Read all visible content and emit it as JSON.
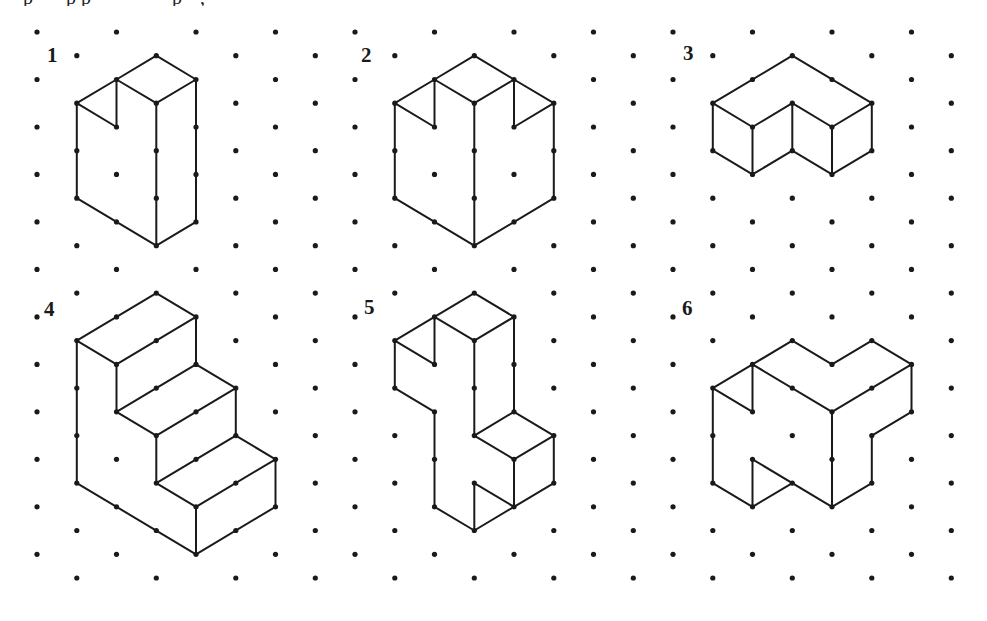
{
  "colors": {
    "background": "#ffffff",
    "dot": "#1a1a1a",
    "line": "#1a1a1a"
  },
  "grid": {
    "type": "isometric-dot",
    "rows": 24,
    "cols_per_row": 12,
    "origin_x": 37,
    "origin_y": 32,
    "half_col_spacing": 39.75,
    "row_spacing": 23.74,
    "dot_radius": 2.6
  },
  "top_text_fragments": [
    {
      "x": 23,
      "text": "p"
    },
    {
      "x": 66,
      "text": "p"
    },
    {
      "x": 81,
      "text": "p"
    },
    {
      "x": 172,
      "text": "p"
    },
    {
      "x": 200,
      "text": ","
    }
  ],
  "figures": [
    {
      "label": "1",
      "label_pos": [
        47,
        62
      ],
      "edges": [
        [
          [
            3,
            1
          ],
          [
            2,
            2
          ]
        ],
        [
          [
            3,
            1
          ],
          [
            4,
            2
          ]
        ],
        [
          [
            2,
            2
          ],
          [
            3,
            3
          ]
        ],
        [
          [
            4,
            2
          ],
          [
            3,
            3
          ]
        ],
        [
          [
            2,
            2
          ],
          [
            1,
            3
          ]
        ],
        [
          [
            2,
            2
          ],
          [
            2,
            4
          ]
        ],
        [
          [
            1,
            3
          ],
          [
            2,
            4
          ]
        ],
        [
          [
            1,
            3
          ],
          [
            1,
            7
          ]
        ],
        [
          [
            3,
            3
          ],
          [
            3,
            9
          ]
        ],
        [
          [
            4,
            2
          ],
          [
            4,
            8
          ]
        ],
        [
          [
            1,
            7
          ],
          [
            3,
            9
          ]
        ],
        [
          [
            3,
            9
          ],
          [
            4,
            8
          ]
        ]
      ]
    },
    {
      "label": "2",
      "label_pos": [
        361,
        62
      ],
      "edges": [
        [
          [
            11,
            1
          ],
          [
            10,
            2
          ]
        ],
        [
          [
            11,
            1
          ],
          [
            12,
            2
          ]
        ],
        [
          [
            10,
            2
          ],
          [
            11,
            3
          ]
        ],
        [
          [
            12,
            2
          ],
          [
            11,
            3
          ]
        ],
        [
          [
            10,
            2
          ],
          [
            9,
            3
          ]
        ],
        [
          [
            10,
            2
          ],
          [
            10,
            4
          ]
        ],
        [
          [
            9,
            3
          ],
          [
            10,
            4
          ]
        ],
        [
          [
            12,
            2
          ],
          [
            13,
            3
          ]
        ],
        [
          [
            12,
            2
          ],
          [
            12,
            4
          ]
        ],
        [
          [
            13,
            3
          ],
          [
            12,
            4
          ]
        ],
        [
          [
            9,
            3
          ],
          [
            9,
            7
          ]
        ],
        [
          [
            11,
            3
          ],
          [
            11,
            9
          ]
        ],
        [
          [
            13,
            3
          ],
          [
            13,
            7
          ]
        ],
        [
          [
            9,
            7
          ],
          [
            11,
            9
          ]
        ],
        [
          [
            11,
            9
          ],
          [
            13,
            7
          ]
        ]
      ]
    },
    {
      "label": "3",
      "label_pos": [
        683,
        60
      ],
      "edges": [
        [
          [
            19,
            1
          ],
          [
            17,
            3
          ]
        ],
        [
          [
            19,
            1
          ],
          [
            21,
            3
          ]
        ],
        [
          [
            17,
            3
          ],
          [
            18,
            4
          ]
        ],
        [
          [
            18,
            4
          ],
          [
            19,
            3
          ]
        ],
        [
          [
            19,
            3
          ],
          [
            20,
            4
          ]
        ],
        [
          [
            20,
            4
          ],
          [
            21,
            3
          ]
        ],
        [
          [
            17,
            3
          ],
          [
            17,
            5
          ]
        ],
        [
          [
            18,
            4
          ],
          [
            18,
            6
          ]
        ],
        [
          [
            19,
            3
          ],
          [
            19,
            5
          ]
        ],
        [
          [
            20,
            4
          ],
          [
            20,
            6
          ]
        ],
        [
          [
            21,
            3
          ],
          [
            21,
            5
          ]
        ],
        [
          [
            17,
            5
          ],
          [
            18,
            6
          ]
        ],
        [
          [
            18,
            6
          ],
          [
            19,
            5
          ]
        ],
        [
          [
            19,
            5
          ],
          [
            20,
            6
          ]
        ],
        [
          [
            20,
            6
          ],
          [
            21,
            5
          ]
        ]
      ]
    },
    {
      "label": "4",
      "label_pos": [
        44,
        316
      ],
      "edges": [
        [
          [
            3,
            11
          ],
          [
            1,
            13
          ]
        ],
        [
          [
            3,
            11
          ],
          [
            4,
            12
          ]
        ],
        [
          [
            1,
            13
          ],
          [
            2,
            14
          ]
        ],
        [
          [
            4,
            12
          ],
          [
            2,
            14
          ]
        ],
        [
          [
            1,
            13
          ],
          [
            1,
            19
          ]
        ],
        [
          [
            2,
            14
          ],
          [
            2,
            16
          ]
        ],
        [
          [
            4,
            12
          ],
          [
            4,
            14
          ]
        ],
        [
          [
            4,
            14
          ],
          [
            5,
            15
          ]
        ],
        [
          [
            4,
            14
          ],
          [
            2,
            16
          ]
        ],
        [
          [
            2,
            16
          ],
          [
            3,
            17
          ]
        ],
        [
          [
            5,
            15
          ],
          [
            3,
            17
          ]
        ],
        [
          [
            5,
            15
          ],
          [
            5,
            17
          ]
        ],
        [
          [
            3,
            17
          ],
          [
            3,
            19
          ]
        ],
        [
          [
            5,
            17
          ],
          [
            6,
            18
          ]
        ],
        [
          [
            5,
            17
          ],
          [
            3,
            19
          ]
        ],
        [
          [
            3,
            19
          ],
          [
            4,
            20
          ]
        ],
        [
          [
            6,
            18
          ],
          [
            4,
            20
          ]
        ],
        [
          [
            6,
            18
          ],
          [
            6,
            20
          ]
        ],
        [
          [
            4,
            20
          ],
          [
            4,
            22
          ]
        ],
        [
          [
            1,
            19
          ],
          [
            4,
            22
          ]
        ],
        [
          [
            4,
            22
          ],
          [
            6,
            20
          ]
        ]
      ]
    },
    {
      "label": "5",
      "label_pos": [
        364,
        314
      ],
      "edges": [
        [
          [
            11,
            11
          ],
          [
            10,
            12
          ]
        ],
        [
          [
            11,
            11
          ],
          [
            12,
            12
          ]
        ],
        [
          [
            10,
            12
          ],
          [
            11,
            13
          ]
        ],
        [
          [
            12,
            12
          ],
          [
            11,
            13
          ]
        ],
        [
          [
            10,
            12
          ],
          [
            9,
            13
          ]
        ],
        [
          [
            10,
            12
          ],
          [
            10,
            14
          ]
        ],
        [
          [
            9,
            13
          ],
          [
            10,
            14
          ]
        ],
        [
          [
            9,
            13
          ],
          [
            9,
            15
          ]
        ],
        [
          [
            9,
            15
          ],
          [
            10,
            16
          ]
        ],
        [
          [
            10,
            16
          ],
          [
            10,
            20
          ]
        ],
        [
          [
            11,
            13
          ],
          [
            11,
            17
          ]
        ],
        [
          [
            12,
            12
          ],
          [
            12,
            16
          ]
        ],
        [
          [
            12,
            16
          ],
          [
            11,
            17
          ]
        ],
        [
          [
            12,
            16
          ],
          [
            13,
            17
          ]
        ],
        [
          [
            11,
            17
          ],
          [
            12,
            18
          ]
        ],
        [
          [
            13,
            17
          ],
          [
            12,
            18
          ]
        ],
        [
          [
            12,
            18
          ],
          [
            12,
            20
          ]
        ],
        [
          [
            13,
            17
          ],
          [
            13,
            19
          ]
        ],
        [
          [
            13,
            19
          ],
          [
            12,
            20
          ]
        ],
        [
          [
            11,
            19
          ],
          [
            12,
            20
          ]
        ],
        [
          [
            11,
            19
          ],
          [
            11,
            21
          ]
        ],
        [
          [
            10,
            20
          ],
          [
            11,
            21
          ]
        ],
        [
          [
            11,
            21
          ],
          [
            12,
            20
          ]
        ]
      ]
    },
    {
      "label": "6",
      "label_pos": [
        682,
        315
      ],
      "edges": [
        [
          [
            18,
            14
          ],
          [
            19,
            13
          ]
        ],
        [
          [
            19,
            13
          ],
          [
            20,
            14
          ]
        ],
        [
          [
            20,
            14
          ],
          [
            21,
            13
          ]
        ],
        [
          [
            21,
            13
          ],
          [
            22,
            14
          ]
        ],
        [
          [
            18,
            14
          ],
          [
            20,
            16
          ]
        ],
        [
          [
            20,
            16
          ],
          [
            22,
            14
          ]
        ],
        [
          [
            18,
            14
          ],
          [
            17,
            15
          ]
        ],
        [
          [
            18,
            14
          ],
          [
            18,
            16
          ]
        ],
        [
          [
            17,
            15
          ],
          [
            18,
            16
          ]
        ],
        [
          [
            17,
            15
          ],
          [
            17,
            19
          ]
        ],
        [
          [
            20,
            16
          ],
          [
            20,
            20
          ]
        ],
        [
          [
            22,
            14
          ],
          [
            22,
            16
          ]
        ],
        [
          [
            22,
            16
          ],
          [
            21,
            17
          ]
        ],
        [
          [
            21,
            17
          ],
          [
            21,
            19
          ]
        ],
        [
          [
            21,
            19
          ],
          [
            20,
            20
          ]
        ],
        [
          [
            17,
            19
          ],
          [
            18,
            20
          ]
        ],
        [
          [
            18,
            20
          ],
          [
            18,
            18
          ]
        ],
        [
          [
            18,
            18
          ],
          [
            20,
            20
          ]
        ],
        [
          [
            18,
            20
          ],
          [
            19,
            19
          ]
        ]
      ]
    }
  ]
}
